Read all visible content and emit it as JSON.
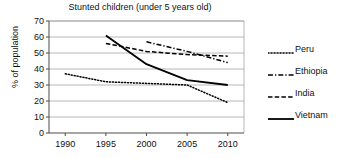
{
  "chart_data": {
    "type": "line",
    "title": "Stunted children (under 5 years old)",
    "xlabel": "",
    "ylabel": "% of population",
    "x": [
      1990,
      1995,
      2000,
      2005,
      2010
    ],
    "xtick_labels": [
      "1990",
      "1995",
      "2000",
      "2005",
      "2010"
    ],
    "ytick_labels": [
      "0",
      "10",
      "20",
      "30",
      "40",
      "50",
      "60",
      "70"
    ],
    "yticks": [
      0,
      10,
      20,
      30,
      40,
      50,
      60,
      70
    ],
    "ylim": [
      0,
      70
    ],
    "xlim": [
      1988,
      2012
    ],
    "grid": "horizontal",
    "legend_position": "right",
    "series": [
      {
        "name": "Peru",
        "style": "dotted",
        "color": "#000000",
        "x": [
          1990,
          1995,
          2000,
          2005,
          2010
        ],
        "values": [
          37,
          32,
          31,
          30,
          19
        ]
      },
      {
        "name": "Ethiopia",
        "style": "dash-dot",
        "color": "#000000",
        "x": [
          2000,
          2005,
          2010
        ],
        "values": [
          57,
          51,
          44
        ]
      },
      {
        "name": "India",
        "style": "dashed",
        "color": "#000000",
        "x": [
          1995,
          2000,
          2005,
          2010
        ],
        "values": [
          56,
          51,
          49,
          48
        ]
      },
      {
        "name": "Vietnam",
        "style": "solid",
        "color": "#000000",
        "x": [
          1995,
          2000,
          2005,
          2010
        ],
        "values": [
          61,
          43,
          33,
          30
        ]
      }
    ]
  },
  "legend": {
    "items": [
      {
        "label": "Peru",
        "sample": "dotted-line-sample"
      },
      {
        "label": "Ethiopia",
        "sample": "dash-dot-line-sample"
      },
      {
        "label": "India",
        "sample": "dashed-line-sample"
      },
      {
        "label": "Vietnam",
        "sample": "solid-line-sample"
      }
    ]
  }
}
